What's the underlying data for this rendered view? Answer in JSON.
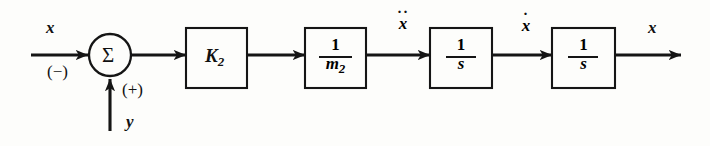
{
  "diagram": {
    "type": "control-system-block-diagram",
    "background_color": "#fdfdfb",
    "line_color": "#151515",
    "input_signal": {
      "label": "x",
      "sign": "(−)"
    },
    "feedback_signal": {
      "label": "y",
      "sign": "(+)"
    },
    "summing_junction": {
      "symbol": "Σ",
      "name": "summing-junction"
    },
    "blocks": [
      {
        "name": "gain-block-k2",
        "kind": "gain",
        "text": "K",
        "subscript": "2"
      },
      {
        "name": "mass-block-inverse-m2",
        "kind": "fraction",
        "numerator": "1",
        "denominator": "m",
        "denominator_subscript": "2"
      },
      {
        "name": "integrator-block-1",
        "kind": "fraction",
        "numerator": "1",
        "denominator": "s"
      },
      {
        "name": "integrator-block-2",
        "kind": "fraction",
        "numerator": "1",
        "denominator": "s"
      }
    ],
    "signal_labels": [
      {
        "name": "acceleration-label",
        "base": "x",
        "dots": 2,
        "meaning": "x-double-dot"
      },
      {
        "name": "velocity-label",
        "base": "x",
        "dots": 1,
        "meaning": "x-dot"
      },
      {
        "name": "position-output-label",
        "base": "x",
        "dots": 0,
        "meaning": "x"
      }
    ]
  }
}
